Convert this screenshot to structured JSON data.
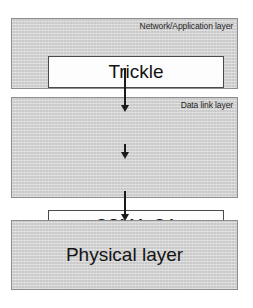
{
  "diagram": {
    "colors": {
      "layer_fill": "#d8d8d8",
      "layer_border": "#8d8d8d",
      "box_fill": "#fdfdfd",
      "box_border": "#4a4a4a",
      "arrow": "#1b1b1b",
      "text": "#141414",
      "page_background": "#ffffff"
    },
    "layers": [
      {
        "id": "network-application",
        "caption": "Network/Application layer",
        "boxes": [
          {
            "id": "trickle",
            "label": "Trickle"
          }
        ]
      },
      {
        "id": "data-link",
        "caption": "Data link layer",
        "boxes": [
          {
            "id": "csma-ca",
            "label": "CSMA-CA"
          },
          {
            "id": "radio-duty-cycling",
            "label": "Radio Duty Cycling"
          }
        ]
      },
      {
        "id": "physical",
        "caption": "",
        "boxes": [
          {
            "id": "physical-layer",
            "label": "Physical layer"
          }
        ]
      }
    ],
    "arrows": [
      {
        "id": "trickle-to-csma",
        "from": "trickle",
        "to": "csma-ca",
        "direction": "down"
      },
      {
        "id": "csma-to-rdc",
        "from": "csma-ca",
        "to": "radio-duty-cycling",
        "direction": "down"
      },
      {
        "id": "rdc-to-physical",
        "from": "radio-duty-cycling",
        "to": "physical-layer",
        "direction": "down"
      }
    ]
  }
}
